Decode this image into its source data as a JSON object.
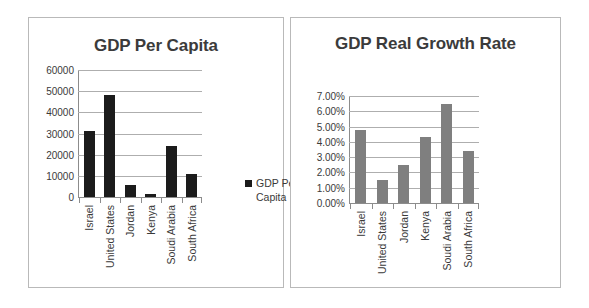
{
  "chart_data": [
    {
      "type": "bar",
      "title": "GDP Per Capita",
      "xlabel": "",
      "ylabel": "",
      "ylim": [
        0,
        60000
      ],
      "yticks": [
        "60000",
        "50000",
        "40000",
        "30000",
        "20000",
        "10000",
        "0"
      ],
      "grid": true,
      "legend_position": "right",
      "legend": [
        "GDP Per Capita"
      ],
      "series_color": "#1b1b1b",
      "categories": [
        "Israel",
        "United States",
        "Jordan",
        "Kenya",
        "Soudi Arabia",
        "South Africa"
      ],
      "values": [
        31000,
        48000,
        5800,
        1400,
        24000,
        11000
      ]
    },
    {
      "type": "bar",
      "title": "GDP Real Growth Rate",
      "xlabel": "",
      "ylabel": "",
      "ylim": [
        0,
        7
      ],
      "yticks": [
        "7.00%",
        "6.00%",
        "5.00%",
        "4.00%",
        "3.00%",
        "2.00%",
        "1.00%",
        "0.00%"
      ],
      "grid": true,
      "legend_position": "right",
      "legend": [
        "GDP Real Growth Rate"
      ],
      "series_color": "#7f7f7f",
      "categories": [
        "Israel",
        "United States",
        "Jordan",
        "Kenya",
        "Soudi Arabia",
        "South Africa"
      ],
      "values": [
        4.8,
        1.5,
        2.5,
        4.3,
        6.5,
        3.4
      ]
    }
  ],
  "left": {
    "title": "GDP Per Capita",
    "legend_label": "GDP Per Capita"
  },
  "right": {
    "title": "GDP Real Growth Rate",
    "legend_label": "GDP Real Growth Rate"
  }
}
